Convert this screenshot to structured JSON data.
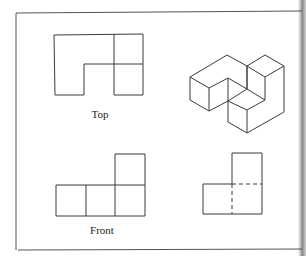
{
  "figure": {
    "views": [
      {
        "id": "top",
        "label": "Top"
      },
      {
        "id": "isometric",
        "label": ""
      },
      {
        "id": "front",
        "label": "Front"
      },
      {
        "id": "side",
        "label": ""
      }
    ],
    "colors": {
      "line": "#3a3a3a",
      "frame": "#555555",
      "background": "#ffffff"
    }
  }
}
